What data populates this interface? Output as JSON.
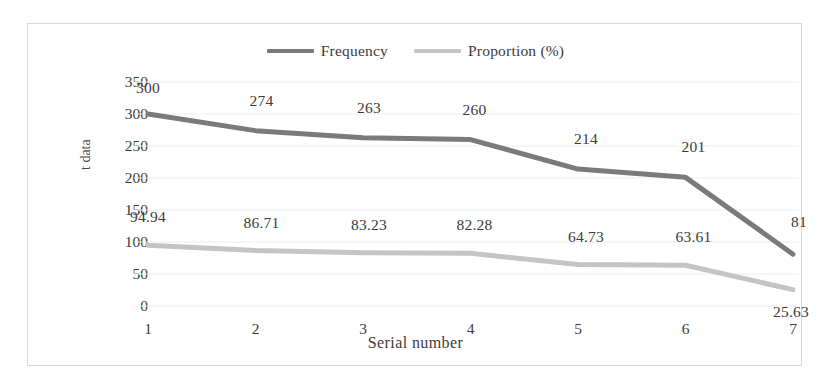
{
  "chart_data": {
    "type": "line",
    "title": "",
    "xlabel": "Serial number",
    "ylabel": "t data",
    "categories": [
      "1",
      "2",
      "3",
      "4",
      "5",
      "6",
      "7"
    ],
    "x": [
      1,
      2,
      3,
      4,
      5,
      6,
      7
    ],
    "ylim": [
      0,
      350
    ],
    "yticks": [
      "0",
      "50",
      "100",
      "150",
      "200",
      "250",
      "300",
      "350"
    ],
    "ytick_values": [
      0,
      50,
      100,
      150,
      200,
      250,
      300,
      350
    ],
    "grid": true,
    "legend_position": "top-center",
    "series": [
      {
        "name": "Frequency",
        "color": "#7a7a7a",
        "values": [
          300,
          274,
          263,
          260,
          214,
          201,
          81
        ],
        "labels": [
          "300",
          "274",
          "263",
          "260",
          "214",
          "201",
          "81"
        ]
      },
      {
        "name": "Proportion (%)",
        "color": "#c4c4c4",
        "values": [
          94.94,
          86.71,
          83.23,
          82.28,
          64.73,
          63.61,
          25.63
        ],
        "labels": [
          "94.94",
          "86.71",
          "83.23",
          "82.28",
          "64.73",
          "63.61",
          "25.63"
        ]
      }
    ]
  },
  "legend": {
    "entries": [
      {
        "label": "Frequency",
        "color": "#7a7a7a"
      },
      {
        "label": "Proportion (%)",
        "color": "#c4c4c4"
      }
    ]
  },
  "axes": {
    "y_title": "t data",
    "x_title": "Serial number",
    "y_ticks": [
      "350",
      "300",
      "250",
      "200",
      "150",
      "100",
      "50",
      "0"
    ],
    "x_ticks": [
      "1",
      "2",
      "3",
      "4",
      "5",
      "6",
      "7"
    ]
  },
  "colors": {
    "frequency_line": "#7a7a7a",
    "proportion_line": "#c4c4c4",
    "gridline": "#ededed",
    "frame_border": "#d8d8d8",
    "text": "#3b3b3b",
    "background": "#ffffff"
  }
}
